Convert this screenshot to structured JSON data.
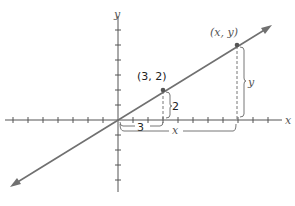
{
  "diagram": {
    "title": "",
    "axes": {
      "x_label": "x",
      "y_label": "y",
      "x_ticks_negative": 8,
      "x_ticks_positive": 10,
      "y_ticks_positive": 7,
      "y_ticks_negative": 5
    },
    "line": {
      "slope_label": "y/x = 2/3",
      "passes_through_origin": true
    },
    "points": [
      {
        "label": "(3, 2)",
        "x": 3,
        "y": 2
      },
      {
        "label": "(x, y)",
        "x": "x",
        "y": "y"
      }
    ],
    "brackets": {
      "small_run_label": "3",
      "small_rise_label": "2",
      "large_run_label": "x",
      "large_rise_label": "y"
    },
    "colors": {
      "axis": "#555555",
      "line": "#707070",
      "text": "#222222"
    }
  }
}
